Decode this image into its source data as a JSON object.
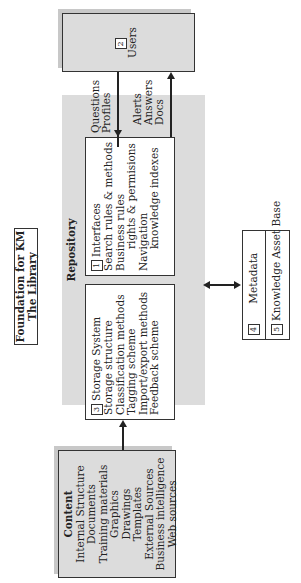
{
  "foundation": {
    "line1": "Foundation for KM",
    "line2": "The Library"
  },
  "repository": {
    "title": "Repository"
  },
  "interfaces": {
    "number": "1",
    "title": "Interfaces",
    "items": [
      "Search rules & methods",
      "Business rules",
      "rights & permisions",
      "Navigation",
      "knowledge indexes"
    ]
  },
  "users": {
    "number": "2",
    "title": "Users"
  },
  "storage": {
    "number": "3",
    "title": "Storage System",
    "items": [
      "Storage structure",
      "Classification methods",
      "Tagging scheme",
      "Import/export methods",
      "Feedback scheme"
    ]
  },
  "metadata": {
    "number": "4",
    "title": "Metadata"
  },
  "knowledge_asset_base": {
    "number": "5",
    "title": "Knowledge Asset Base"
  },
  "content": {
    "title": "Content",
    "items": [
      "Internal Structure",
      "Documents",
      "Training materials",
      "Graphics",
      "Drawings",
      "Templates",
      "External Sources",
      "Business intelligence",
      "Web sources"
    ]
  },
  "flows": {
    "to_repository": [
      "Questions",
      "Profiles"
    ],
    "to_users": [
      "Alerts",
      "Answers",
      "Docs"
    ]
  },
  "colors": {
    "gray_fill": "#dcdcdc",
    "border": "#333333",
    "background": "#ffffff"
  }
}
